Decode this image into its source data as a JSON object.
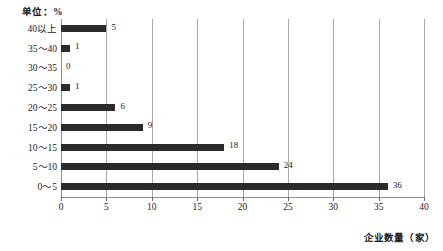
{
  "chart_data": {
    "type": "bar",
    "orientation": "horizontal",
    "title": "",
    "unit_note": "单位：%",
    "xlabel": "企业数量（家）",
    "ylabel": "",
    "categories": [
      "0～5",
      "5～10",
      "10～15",
      "15～20",
      "20～25",
      "25～30",
      "30～35",
      "35～40",
      "40以上"
    ],
    "values": [
      36,
      24,
      18,
      9,
      6,
      1,
      0,
      1,
      5
    ],
    "value_labels": [
      "36",
      "24",
      "18",
      "9",
      "6",
      "1",
      "0",
      "1",
      "5"
    ],
    "xlim": [
      0,
      40
    ],
    "xticks": [
      0,
      5,
      10,
      15,
      20,
      25,
      30,
      35,
      40
    ],
    "xtick_labels": [
      "0",
      "5",
      "10",
      "15",
      "20",
      "25",
      "30",
      "35",
      "40"
    ],
    "grid": true,
    "grid_axis": "x",
    "legend": null,
    "bar_color": "#2b2b2b",
    "grid_color": "#a9a9a9",
    "axis_color": "#8e8e8e",
    "background_color": "#ffffff",
    "category_order_top_to_bottom": [
      "40以上",
      "35～40",
      "30～35",
      "25～30",
      "20～25",
      "15～20",
      "10～15",
      "5～10",
      "0～5"
    ],
    "values_top_to_bottom": [
      5,
      1,
      0,
      1,
      6,
      9,
      18,
      24,
      36
    ]
  }
}
